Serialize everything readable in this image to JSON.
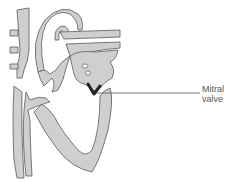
{
  "diagram": {
    "labels": [
      {
        "id": "mitral-valve",
        "lines": [
          "Mitral",
          "valve"
        ]
      }
    ],
    "colors": {
      "tissue_fill": "#cfcfcf",
      "outline": "#6a6a6a",
      "valve": "#222222",
      "leader_line": "#555555",
      "background": "#ffffff"
    }
  }
}
